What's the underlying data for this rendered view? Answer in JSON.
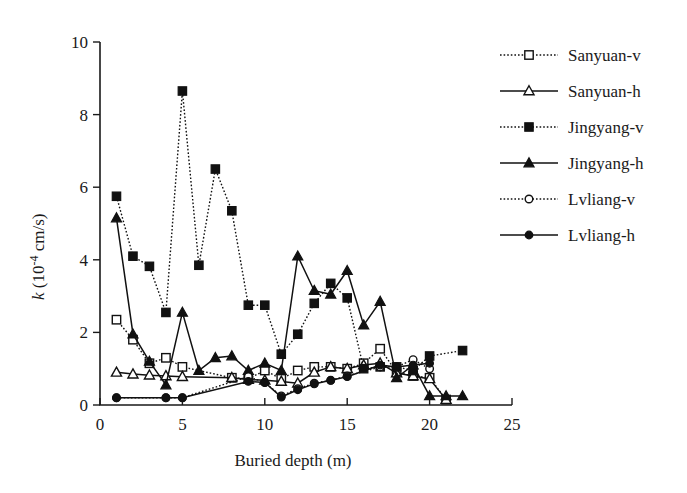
{
  "chart_data": {
    "type": "line",
    "title": "",
    "xlabel": "Buried depth (m)",
    "ylabel": "k (10-4 cm/s)",
    "ylabel_parts": {
      "symbol": "k",
      "open": " (10",
      "exp": "-4",
      "close": " cm/s)"
    },
    "xlim": [
      0,
      25
    ],
    "ylim": [
      0,
      10
    ],
    "xticks": [
      0,
      5,
      10,
      15,
      20,
      25
    ],
    "yticks": [
      0,
      2,
      4,
      6,
      8,
      10
    ],
    "xtick_labels": [
      "0",
      "5",
      "10",
      "15",
      "20",
      "25"
    ],
    "ytick_labels": [
      "0",
      "2",
      "4",
      "6",
      "8",
      "10"
    ],
    "grid": false,
    "legend_position": "upper right",
    "series": [
      {
        "name": "Sanyuan-v",
        "marker": "open-square",
        "line": "dotted",
        "x": [
          1,
          2,
          3,
          4,
          5,
          8,
          9,
          10,
          11,
          12,
          13,
          14,
          15,
          16,
          17,
          18,
          19,
          20,
          21
        ],
        "y": [
          2.35,
          1.8,
          1.15,
          1.3,
          1.05,
          0.75,
          0.72,
          0.95,
          0.72,
          0.95,
          1.05,
          1.05,
          1.0,
          1.15,
          1.55,
          0.9,
          0.8,
          0.75,
          0.15
        ]
      },
      {
        "name": "Sanyuan-h",
        "marker": "open-triangle",
        "line": "solid",
        "x": [
          1,
          2,
          3,
          4,
          5,
          8,
          9,
          10,
          11,
          12,
          13,
          14,
          15,
          16,
          17,
          18,
          19,
          20,
          21
        ],
        "y": [
          0.9,
          0.85,
          0.82,
          0.8,
          0.78,
          0.75,
          0.7,
          0.68,
          0.65,
          0.6,
          0.9,
          1.05,
          1.0,
          1.1,
          1.15,
          0.88,
          0.8,
          0.72,
          0.15
        ]
      },
      {
        "name": "Jingyang-v",
        "marker": "filled-square",
        "line": "dotted",
        "x": [
          1,
          2,
          3,
          4,
          5,
          6,
          7,
          8,
          9,
          10,
          11,
          12,
          13,
          14,
          15,
          16,
          17,
          18,
          19,
          20,
          22
        ],
        "y": [
          5.75,
          4.1,
          3.82,
          2.55,
          8.65,
          3.85,
          6.5,
          5.35,
          2.75,
          2.75,
          1.4,
          1.95,
          2.8,
          3.35,
          2.95,
          1.0,
          1.05,
          1.05,
          0.95,
          1.35,
          1.5
        ]
      },
      {
        "name": "Jingyang-h",
        "marker": "filled-triangle",
        "line": "solid",
        "x": [
          1,
          2,
          3,
          4,
          5,
          6,
          7,
          8,
          9,
          10,
          11,
          12,
          13,
          14,
          15,
          16,
          17,
          18,
          19,
          20,
          21,
          22
        ],
        "y": [
          5.15,
          1.95,
          1.2,
          0.55,
          2.55,
          0.95,
          1.3,
          1.35,
          0.95,
          1.15,
          0.95,
          4.1,
          3.15,
          3.05,
          3.7,
          2.2,
          2.85,
          0.75,
          1.1,
          0.25,
          0.25,
          0.25
        ]
      },
      {
        "name": "Lvliang-v",
        "marker": "open-circle",
        "line": "dotted",
        "x": [
          1,
          4,
          5,
          9,
          10,
          11,
          12,
          13,
          14,
          15,
          17,
          18,
          19,
          20
        ],
        "y": [
          0.2,
          0.2,
          0.2,
          0.78,
          0.62,
          0.25,
          0.45,
          0.6,
          0.68,
          0.8,
          1.05,
          1.05,
          1.25,
          1.0
        ]
      },
      {
        "name": "Lvliang-h",
        "marker": "filled-circle",
        "line": "solid",
        "x": [
          1,
          4,
          5,
          9,
          10,
          11,
          12,
          13,
          14,
          15,
          17,
          18,
          19,
          20
        ],
        "y": [
          0.2,
          0.2,
          0.2,
          0.65,
          0.62,
          0.22,
          0.42,
          0.58,
          0.68,
          0.78,
          1.1,
          1.05,
          1.1,
          1.15
        ]
      }
    ]
  },
  "legend": {
    "items": [
      {
        "label": "Sanyuan-v"
      },
      {
        "label": "Sanyuan-h"
      },
      {
        "label": "Jingyang-v"
      },
      {
        "label": "Jingyang-h"
      },
      {
        "label": "Lvliang-v"
      },
      {
        "label": "Lvliang-h"
      }
    ]
  }
}
